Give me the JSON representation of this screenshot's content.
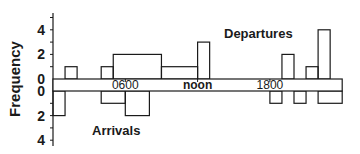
{
  "chart_data": {
    "type": "bar",
    "title": "",
    "ylabel": "Frequency",
    "xlabel": "",
    "x_unit": "hour of day",
    "x_range": [
      0,
      24
    ],
    "x_ticks": [
      {
        "hour": 6,
        "label": "0600"
      },
      {
        "hour": 12,
        "label": "noon"
      },
      {
        "hour": 18,
        "label": "1800"
      }
    ],
    "y_ticks_upper": [
      "0",
      "2",
      "4"
    ],
    "y_ticks_lower": [
      "0",
      "2",
      "4"
    ],
    "ylim": [
      0,
      5
    ],
    "grid": false,
    "series": [
      {
        "name": "Departures",
        "direction": "up",
        "bins": [
          {
            "start": 1,
            "end": 2,
            "value": 1
          },
          {
            "start": 4,
            "end": 5,
            "value": 1
          },
          {
            "start": 5,
            "end": 9,
            "value": 2
          },
          {
            "start": 9,
            "end": 12,
            "value": 1
          },
          {
            "start": 12,
            "end": 13,
            "value": 3
          },
          {
            "start": 19,
            "end": 20,
            "value": 2
          },
          {
            "start": 21,
            "end": 22,
            "value": 1
          },
          {
            "start": 22,
            "end": 23,
            "value": 4
          }
        ]
      },
      {
        "name": "Arrivals",
        "direction": "down",
        "bins": [
          {
            "start": 0,
            "end": 1,
            "value": 2
          },
          {
            "start": 4,
            "end": 6,
            "value": 1
          },
          {
            "start": 6,
            "end": 8,
            "value": 2
          },
          {
            "start": 18,
            "end": 19,
            "value": 1
          },
          {
            "start": 20,
            "end": 21,
            "value": 1
          },
          {
            "start": 22,
            "end": 24,
            "value": 1
          }
        ]
      }
    ],
    "annotations": [
      "Departures",
      "Arrivals"
    ]
  },
  "labels": {
    "ylabel": "Frequency",
    "departures": "Departures",
    "arrivals": "Arrivals"
  },
  "colors": {
    "line": "#1a1a1a",
    "background": "#ffffff"
  }
}
